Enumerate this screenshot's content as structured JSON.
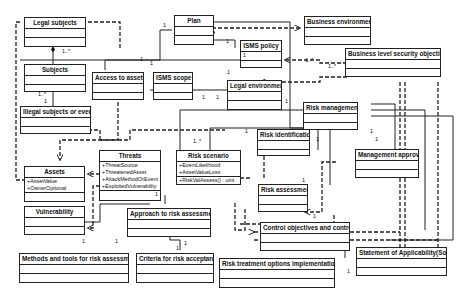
{
  "diagram": {
    "type": "UML class diagram",
    "classes": [
      {
        "id": "legal_subjects",
        "name": "Legal subjects",
        "attributes": [],
        "operations": []
      },
      {
        "id": "subjects",
        "name": "Subjects",
        "attributes": [],
        "operations": []
      },
      {
        "id": "illegal_subjects",
        "name": "Illegal subjects or events",
        "attributes": [],
        "operations": []
      },
      {
        "id": "access_to_assets",
        "name": "Access to assets",
        "attributes": [],
        "operations": []
      },
      {
        "id": "plan",
        "name": "Plan",
        "attributes": [],
        "operations": []
      },
      {
        "id": "isms_policy",
        "name": "ISMS policy",
        "attributes": [
          "1"
        ],
        "operations": []
      },
      {
        "id": "isms_scope",
        "name": "ISMS scope",
        "attributes": [],
        "operations": []
      },
      {
        "id": "legal_environment",
        "name": "Legal environment",
        "attributes": [],
        "operations": []
      },
      {
        "id": "business_environment",
        "name": "Business environment",
        "attributes": [],
        "operations": []
      },
      {
        "id": "business_level_objectives",
        "name": "Business level security objectives",
        "attributes": [],
        "operations": []
      },
      {
        "id": "risk_management",
        "name": "Risk management",
        "attributes": [],
        "operations": []
      },
      {
        "id": "risk_identification",
        "name": "Risk identification",
        "attributes": [],
        "operations": []
      },
      {
        "id": "assets",
        "name": "Assets",
        "attributes": [
          "+AssetValue",
          "+OwnerOptional"
        ],
        "operations": []
      },
      {
        "id": "threats",
        "name": "Threats",
        "attributes": [
          "+ThreatSource",
          "+ThreatenedAsset",
          "+AttackMethodOrEvent",
          "+ExploitedVulnerability"
        ],
        "operations": [
          "1"
        ]
      },
      {
        "id": "risk_scenario",
        "name": "Risk scenario",
        "attributes": [
          "+EventLikelihood",
          "+AssetValueLoss"
        ],
        "operations": [
          "+RiskValAssess() : uint"
        ]
      },
      {
        "id": "management_approval",
        "name": "Management approval",
        "attributes": [],
        "operations": []
      },
      {
        "id": "risk_assessment",
        "name": "Risk assessment",
        "attributes": [],
        "operations": []
      },
      {
        "id": "vulnerability",
        "name": "Vulnerability",
        "attributes": [],
        "operations": []
      },
      {
        "id": "approach",
        "name": "Approach to risk assessment",
        "attributes": [],
        "operations": []
      },
      {
        "id": "control_objectives",
        "name": "Control objectives and controls",
        "attributes": [],
        "operations": []
      },
      {
        "id": "methods_tools",
        "name": "Methods and tools for risk assessment",
        "attributes": [],
        "operations": []
      },
      {
        "id": "criteria",
        "name": "Criteria for risk acceptance",
        "attributes": [],
        "operations": []
      },
      {
        "id": "risk_treatment",
        "name": "Risk treatment options implementation",
        "attributes": [],
        "operations": []
      },
      {
        "id": "soa",
        "name": "Statement of Applicability(SoA)",
        "attributes": [],
        "operations": []
      }
    ],
    "multiplicities": {
      "m1": "1..*",
      "m2": "1..*",
      "m3": "1",
      "m4": "1",
      "m5": "1",
      "m6": "1",
      "m7": "1",
      "m8": "1",
      "m9": "1",
      "m10": "1",
      "m11": "1..*",
      "m12": "1..*",
      "m13": "1",
      "m14": "1..*",
      "m15": "1",
      "m16": "1",
      "m17": "1",
      "m18": "1",
      "m19": "1",
      "m20": "1",
      "m21": "1",
      "m22": "1",
      "m23": "1",
      "m24": "1",
      "m25": "1"
    }
  }
}
